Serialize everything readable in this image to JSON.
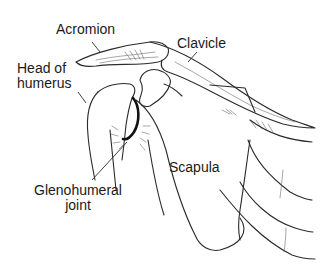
{
  "figure": {
    "labels": [
      {
        "id": "acromion",
        "text": "Acromion"
      },
      {
        "id": "clavicle",
        "text": "Clavicle"
      },
      {
        "id": "head-of-humerus",
        "line1": "Head of",
        "line2": "humerus"
      },
      {
        "id": "scapula",
        "text": "Scapula"
      },
      {
        "id": "glenohumeral-joint",
        "line1": "Glenohumeral",
        "line2": "joint"
      }
    ],
    "colors": {
      "ink": "#2b2b2b",
      "background": "#ffffff"
    }
  }
}
